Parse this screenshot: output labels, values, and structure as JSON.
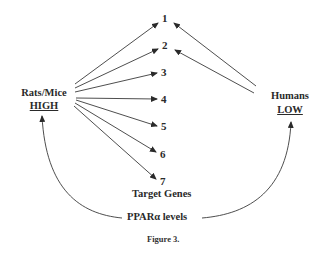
{
  "diagram": {
    "left_node": {
      "species": "Rats/Mice",
      "level": "HIGH"
    },
    "right_node": {
      "species": "Humans",
      "level": "LOW"
    },
    "genes": [
      "1",
      "2",
      "3",
      "4",
      "5",
      "6",
      "7"
    ],
    "genes_label": "Target Genes",
    "bottom_label": "PPARα  levels",
    "caption": "Figure 3.",
    "edges": [
      {
        "from": "Rats/Mice",
        "to": "1"
      },
      {
        "from": "Rats/Mice",
        "to": "2"
      },
      {
        "from": "Rats/Mice",
        "to": "3"
      },
      {
        "from": "Rats/Mice",
        "to": "4"
      },
      {
        "from": "Rats/Mice",
        "to": "5"
      },
      {
        "from": "Rats/Mice",
        "to": "6"
      },
      {
        "from": "Rats/Mice",
        "to": "7"
      },
      {
        "from": "Humans",
        "to": "1"
      },
      {
        "from": "Humans",
        "to": "2"
      },
      {
        "from": "PPARα levels",
        "to": "Rats/Mice"
      },
      {
        "from": "PPARα levels",
        "to": "Humans"
      }
    ]
  }
}
